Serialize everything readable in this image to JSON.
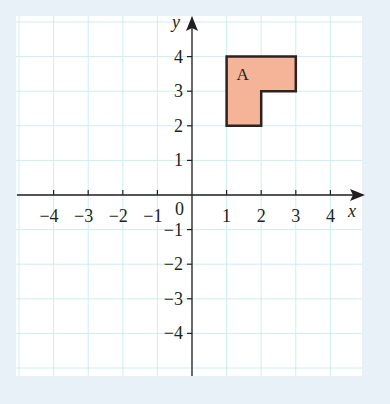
{
  "figure": {
    "type": "coordinate-grid",
    "x_axis": {
      "label": "x",
      "ticks": [
        "-4",
        "-3",
        "-2",
        "-1",
        "1",
        "2",
        "3",
        "4"
      ],
      "range": [
        -5,
        5
      ]
    },
    "y_axis": {
      "label": "y",
      "ticks": [
        "4",
        "3",
        "2",
        "1",
        "-1",
        "-2",
        "-3",
        "-4"
      ],
      "range": [
        -5,
        4.5
      ]
    },
    "origin_label": "0",
    "shapes": [
      {
        "name": "A",
        "label": "A",
        "vertices": [
          [
            1,
            4
          ],
          [
            3,
            4
          ],
          [
            3,
            3
          ],
          [
            2,
            3
          ],
          [
            2,
            2
          ],
          [
            1,
            2
          ]
        ],
        "fill": "#f5b497",
        "stroke": "#2b2222"
      }
    ],
    "colors": {
      "background": "#e9f1f8",
      "paper": "#ffffff",
      "grid": "#cdeef0",
      "axis": "#231f20"
    }
  }
}
